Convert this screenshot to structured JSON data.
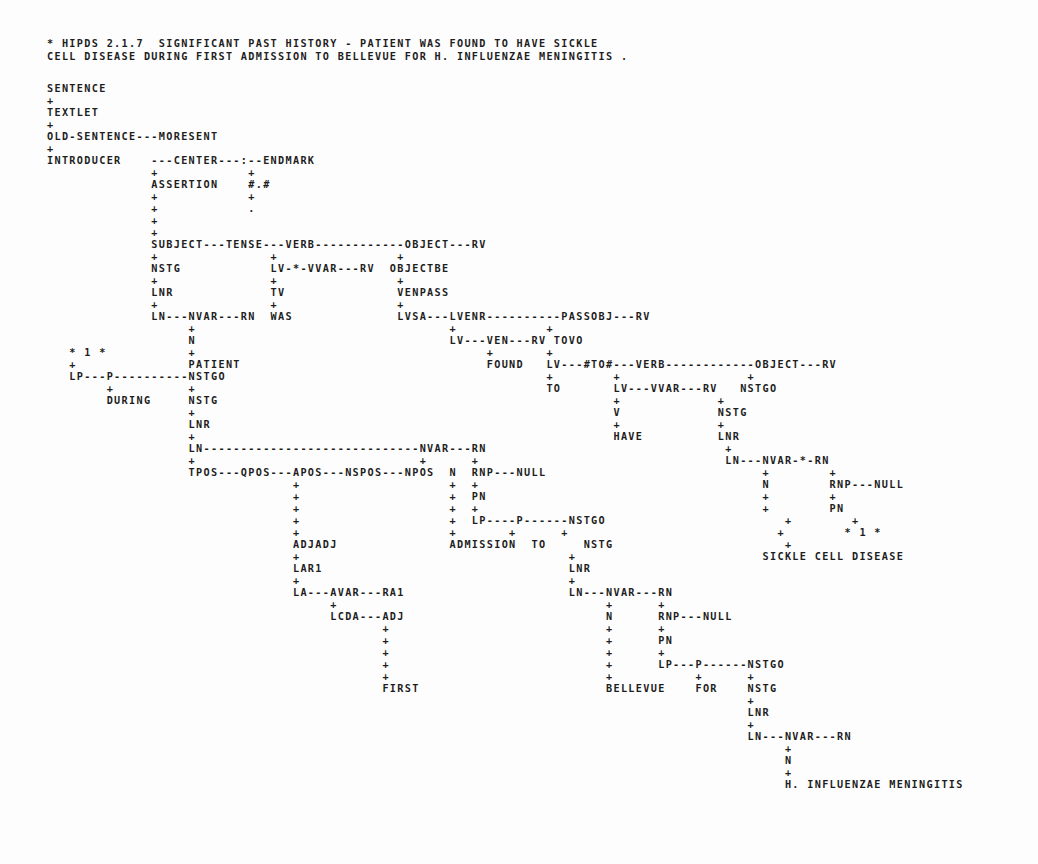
{
  "document": {
    "kind": "line-printer-parse-tree",
    "system_header": "* HIPDS 2.1.7  SIGNIFICANT PAST HISTORY - PATIENT WAS FOUND TO HAVE SICKLE",
    "system_header_line2": "CELL DISEASE DURING FIRST ADMISSION TO BELLEVUE FOR H. INFLUENZAE MENINGITIS .",
    "sentence_text": "PATIENT WAS FOUND TO HAVE SICKLE CELL DISEASE DURING FIRST ADMISSION TO BELLEVUE FOR H. INFLUENZAE MENINGITIS .",
    "program": "HIPDS",
    "version": "2.1.7",
    "title": "SIGNIFICANT PAST HISTORY",
    "ink_color": "#1d1d1d",
    "paper_color": "#fdfdfd"
  },
  "header": {
    "line1": "* HIPDS 2.1.7  SIGNIFICANT PAST HISTORY - PATIENT WAS FOUND TO HAVE SICKLE",
    "line2": "CELL DISEASE DURING FIRST ADMISSION TO BELLEVUE FOR H. INFLUENZAE MENINGITIS ."
  },
  "tree": {
    "root_chain": [
      "SENTENCE",
      "TEXTLET",
      "OLD-SENTENCE",
      "INTRODUCER"
    ],
    "nodes": [
      "SENTENCE",
      "TEXTLET",
      "OLD-SENTENCE",
      "MORESENT",
      "INTRODUCER",
      "CENTER",
      "ENDMARK",
      "ASSERTION",
      "#.#",
      "SUBJECT",
      "TENSE",
      "VERB",
      "OBJECT",
      "RV",
      "NSTG",
      "LV",
      "VVAR",
      "OBJECTBE",
      "LNR",
      "TV",
      "VENPASS",
      "LN",
      "NVAR",
      "RN",
      "WAS",
      "LVSA",
      "LVENR",
      "PASSOBJ",
      "N",
      "VEN",
      "TOVO",
      "PATIENT",
      "FOUND",
      "LP",
      "P",
      "NSTGO",
      "#TO#",
      "TO",
      "DURING",
      "HAVE",
      "V",
      "TPOS",
      "QPOS",
      "APOS",
      "NSPOS",
      "NPOS",
      "RNP",
      "NULL",
      "PN",
      "ADJADJ",
      "LAR1",
      "LA",
      "AVAR",
      "RA1",
      "LCDA",
      "ADJ",
      "ADMISSION",
      "FIRST",
      "BELLEVUE",
      "FOR",
      "SICKLE CELL DISEASE",
      "H. INFLUENZAE MENINGITIS",
      "* 1 *"
    ],
    "leaf_words": [
      "PATIENT",
      "WAS",
      "FOUND",
      "TO",
      "HAVE",
      "SICKLE CELL DISEASE",
      "DURING",
      "FIRST",
      "ADMISSION",
      "TO",
      "BELLEVUE",
      "FOR",
      "H. INFLUENZAE MENINGITIS"
    ]
  },
  "lines": [
    {
      "y": 38,
      "text": "* HIPDS 2.1.7  SIGNIFICANT PAST HISTORY - PATIENT WAS FOUND TO HAVE SICKLE"
    },
    {
      "y": 51,
      "text": "CELL DISEASE DURING FIRST ADMISSION TO BELLEVUE FOR H. INFLUENZAE MENINGITIS ."
    },
    {
      "y": 83,
      "text": "SENTENCE"
    },
    {
      "y": 95,
      "text": "+"
    },
    {
      "y": 107,
      "text": "TEXTLET"
    },
    {
      "y": 119,
      "text": "+"
    },
    {
      "y": 131,
      "text": "OLD-SENTENCE---MORESENT"
    },
    {
      "y": 143,
      "text": "+"
    },
    {
      "y": 155,
      "text": "INTRODUCER    ---CENTER---:--ENDMARK"
    },
    {
      "y": 167,
      "text": "              +            +"
    },
    {
      "y": 179,
      "text": "              ASSERTION    #.#"
    },
    {
      "y": 191,
      "text": "              +            +"
    },
    {
      "y": 203,
      "text": "              +            ."
    },
    {
      "y": 215,
      "text": "              +"
    },
    {
      "y": 227,
      "text": "              +"
    },
    {
      "y": 239,
      "text": "              SUBJECT---TENSE---VERB------------OBJECT---RV"
    },
    {
      "y": 251,
      "text": "              +               +                +"
    },
    {
      "y": 263,
      "text": "              NSTG            LV-*-VVAR---RV  OBJECTBE"
    },
    {
      "y": 275,
      "text": "              +               +                +"
    },
    {
      "y": 287,
      "text": "              LNR             TV               VENPASS"
    },
    {
      "y": 299,
      "text": "              +               +                +"
    },
    {
      "y": 311,
      "text": "              LN---NVAR---RN  WAS              LVSA---LVENR----------PASSOBJ---RV"
    },
    {
      "y": 323,
      "text": "                   +                                  +            +"
    },
    {
      "y": 335,
      "text": "                   N                                  LV---VEN---RV TOVO"
    },
    {
      "y": 347,
      "text": "   * 1 *           +                                       +       +"
    },
    {
      "y": 359,
      "text": "   +               PATIENT                                 FOUND   LV---#TO#---VERB------------OBJECT---RV"
    },
    {
      "y": 371,
      "text": "   LP---P----------NSTGO                                           +        +                 +"
    },
    {
      "y": 383,
      "text": "        +          +                                               TO       LV---VVAR---RV   NSTGO"
    },
    {
      "y": 395,
      "text": "        DURING     NSTG                                                     +             +"
    },
    {
      "y": 407,
      "text": "                   +                                                        V             NSTG"
    },
    {
      "y": 419,
      "text": "                   LNR                                                      +             +"
    },
    {
      "y": 431,
      "text": "                   +                                                        HAVE          LNR"
    },
    {
      "y": 443,
      "text": "                   LN-----------------------------NVAR---RN                                +"
    },
    {
      "y": 455,
      "text": "                   +                              +      +                                 LN---NVAR-*-RN"
    },
    {
      "y": 467,
      "text": "                   TPOS---QPOS---APOS---NSPOS---NPOS  N  RNP---NULL                             +        +"
    },
    {
      "y": 479,
      "text": "                                 +                    +  +                                      N        RNP---NULL"
    },
    {
      "y": 491,
      "text": "                                 +                    +  PN                                     +        +"
    },
    {
      "y": 503,
      "text": "                                 +                    +  +                                      +        PN"
    },
    {
      "y": 515,
      "text": "                                 +                    +  LP----P------NSTGO                        +        +"
    },
    {
      "y": 527,
      "text": "                                 +                    +       +      +                            +        * 1 *"
    },
    {
      "y": 539,
      "text": "                                 ADJADJ               ADMISSION  TO     NSTG                       +"
    },
    {
      "y": 551,
      "text": "                                 +                                    +                         SICKLE CELL DISEASE"
    },
    {
      "y": 563,
      "text": "                                 LAR1                                 LNR"
    },
    {
      "y": 575,
      "text": "                                 +                                    +"
    },
    {
      "y": 587,
      "text": "                                 LA---AVAR---RA1                      LN---NVAR---RN"
    },
    {
      "y": 599,
      "text": "                                      +                                    +      +"
    },
    {
      "y": 611,
      "text": "                                      LCDA---ADJ                           N      RNP---NULL"
    },
    {
      "y": 623,
      "text": "                                             +                             +      +"
    },
    {
      "y": 635,
      "text": "                                             +                             +      PN"
    },
    {
      "y": 647,
      "text": "                                             +                             +      +"
    },
    {
      "y": 659,
      "text": "                                             +                             +      LP---P------NSTGO"
    },
    {
      "y": 671,
      "text": "                                             +                             +           +      +"
    },
    {
      "y": 683,
      "text": "                                             FIRST                         BELLEVUE    FOR    NSTG"
    },
    {
      "y": 695,
      "text": "                                                                                              +"
    },
    {
      "y": 707,
      "text": "                                                                                              LNR"
    },
    {
      "y": 719,
      "text": "                                                                                              +"
    },
    {
      "y": 731,
      "text": "                                                                                              LN---NVAR---RN"
    },
    {
      "y": 743,
      "text": "                                                                                                   +"
    },
    {
      "y": 755,
      "text": "                                                                                                   N"
    },
    {
      "y": 767,
      "text": "                                                                                                   +"
    },
    {
      "y": 779,
      "text": "                                                                                                   H. INFLUENZAE MENINGITIS"
    }
  ]
}
